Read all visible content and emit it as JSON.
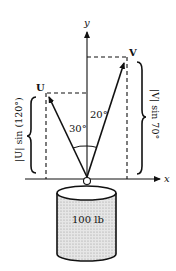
{
  "diagram": {
    "axes": {
      "x_label": "x",
      "y_label": "y"
    },
    "vectors": [
      {
        "name": "U",
        "label": "U",
        "angle_from_y": "30°",
        "component_label": "|U| sin (120°)"
      },
      {
        "name": "V",
        "label": "V",
        "angle_from_y": "20°",
        "component_label": "|V| sin 70°"
      }
    ],
    "weight": {
      "label": "100 lb"
    },
    "colors": {
      "ink": "#111111",
      "fill": "#d8d8d8",
      "background": "#ffffff"
    }
  }
}
